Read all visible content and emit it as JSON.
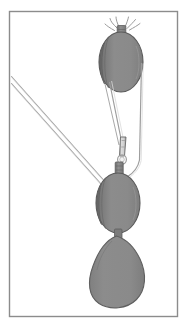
{
  "figure": {
    "title": "Block and tackle with pear-shaped weight",
    "caption": "",
    "background_color": "#ffffff",
    "canvas": {
      "width": 195,
      "height": 328
    }
  },
  "frame": {
    "name": "illustration-border",
    "stroke_color": "#8c8c8c",
    "stroke_width": 1.4,
    "x": 9.5,
    "y": 11.5,
    "width": 168,
    "height": 305
  },
  "palette": {
    "block_fill": "#8a8a8a",
    "block_fill_light": "#949494",
    "block_shade_dark": "#6f6f6f",
    "block_outline": "#555555",
    "rope_stroke": "#8e8e8e",
    "rope_stroke_light": "#b4b4b4",
    "hook_fill": "#d8d8d8",
    "hook_outline": "#6a6a6a",
    "weight_fill": "#8a8a8a",
    "highlight": "#e4e4e4"
  },
  "parts": [
    {
      "id": "upper-becket",
      "label": "Upper becket rope strands",
      "description": "Splayed rope strands seized at the head of the upper block",
      "strand_count": 4
    },
    {
      "id": "upper-block-neck",
      "label": "Upper block neck",
      "description": "Short rectangular seizing between becket and shell"
    },
    {
      "id": "upper-block",
      "label": "Upper (standing) block",
      "description": "Oval pulley shell, fixed aloft",
      "center_x": 121,
      "center_y": 62,
      "radius_x": 22,
      "radius_y": 30
    },
    {
      "id": "fall-left-upper",
      "label": "Left rope fall (upper span)",
      "description": "Rope running from upper block sheave down to the shackle"
    },
    {
      "id": "fall-right-vertical",
      "label": "Right standing part",
      "description": "Near-vertical rope from upper block down to lower block"
    },
    {
      "id": "shackle",
      "label": "Shackle / hook link",
      "description": "Tapered metal link joining the fall to the lower block"
    },
    {
      "id": "lower-block-neck",
      "label": "Lower block neck",
      "description": "Seizing at the head of the lower block"
    },
    {
      "id": "lower-block",
      "label": "Lower (running) block",
      "description": "Oval pulley shell, travelling block",
      "center_x": 118,
      "center_y": 203,
      "radius_x": 22,
      "radius_y": 30
    },
    {
      "id": "hauling-parts",
      "label": "Hauling parts",
      "description": "Two parallel rope falls leading away to the upper left",
      "line_count": 2
    },
    {
      "id": "weight-eye",
      "label": "Weight eye / thimble",
      "description": "Light coloured eye at the top of the suspended weight"
    },
    {
      "id": "weight",
      "label": "Pear-shaped weight",
      "description": "Teardrop shaped bag or weight hanging from the lower block",
      "center_x": 117,
      "center_y": 280
    }
  ],
  "annotations": []
}
